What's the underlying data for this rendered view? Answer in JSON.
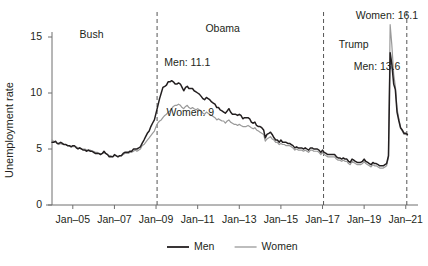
{
  "chart_data": {
    "type": "line",
    "title": "",
    "xlabel": "",
    "ylabel": "Unemployment rate",
    "xlim": [
      2004.0,
      2021.3
    ],
    "ylim": [
      0,
      17.5
    ],
    "yticks": [
      0,
      5,
      10,
      15
    ],
    "ytick_labels": [
      "0",
      "5",
      "10",
      "15"
    ],
    "xticks": [
      2005.0,
      2007.0,
      2009.0,
      2011.0,
      2013.0,
      2015.0,
      2017.0,
      2019.0,
      2021.0
    ],
    "xtick_labels": [
      "Jan–05",
      "Jan–07",
      "Jan–09",
      "Jan–11",
      "Jan–13",
      "Jan–15",
      "Jan–17",
      "Jan–19",
      "Jan–21"
    ],
    "grid": false,
    "legend_position": "bottom-center",
    "colors": {
      "men": "#231f20",
      "women": "#9a9a9a",
      "axis": "#6f6f6f",
      "annotation_line": "#555555"
    },
    "annotations": [
      {
        "id": "bush",
        "text": "Bush",
        "x": 2005.9,
        "y": 15.2
      },
      {
        "id": "obama",
        "text": "Obama",
        "x": 2012.2,
        "y": 15.7
      },
      {
        "id": "trump",
        "text": "Trump",
        "x": 2018.5,
        "y": 14.3
      },
      {
        "id": "men-peak-2009",
        "text": "Men: 11.1",
        "x": 2009.4,
        "y": 12.7
      },
      {
        "id": "women-peak-2009",
        "text": "Women: 9",
        "x": 2009.5,
        "y": 8.2
      },
      {
        "id": "women-peak-2020",
        "text": "Women: 16.1",
        "x": 2018.6,
        "y": 16.9
      },
      {
        "id": "men-peak-2020",
        "text": "Men: 13.6",
        "x": 2018.5,
        "y": 12.3
      }
    ],
    "vertical_markers": [
      {
        "id": "inauguration-2009",
        "x": 2009.05,
        "style": "dashed"
      },
      {
        "id": "inauguration-2017",
        "x": 2017.05,
        "style": "dashed"
      },
      {
        "id": "inauguration-2021",
        "x": 2021.05,
        "style": "dashed"
      }
    ],
    "legend": [
      {
        "id": "men",
        "label": "Men",
        "color": "#231f20"
      },
      {
        "id": "women",
        "label": "Women",
        "color": "#9a9a9a"
      }
    ],
    "series": [
      {
        "name": "Men",
        "color": "#231f20",
        "x": [
          2004.0,
          2004.08,
          2004.17,
          2004.25,
          2004.33,
          2004.42,
          2004.5,
          2004.58,
          2004.67,
          2004.75,
          2004.83,
          2004.92,
          2005.0,
          2005.08,
          2005.17,
          2005.25,
          2005.33,
          2005.42,
          2005.5,
          2005.58,
          2005.67,
          2005.75,
          2005.83,
          2005.92,
          2006.0,
          2006.08,
          2006.17,
          2006.25,
          2006.33,
          2006.42,
          2006.5,
          2006.58,
          2006.67,
          2006.75,
          2006.83,
          2006.92,
          2007.0,
          2007.08,
          2007.17,
          2007.25,
          2007.33,
          2007.42,
          2007.5,
          2007.58,
          2007.67,
          2007.75,
          2007.83,
          2007.92,
          2008.0,
          2008.08,
          2008.17,
          2008.25,
          2008.33,
          2008.42,
          2008.5,
          2008.58,
          2008.67,
          2008.75,
          2008.83,
          2008.92,
          2009.0,
          2009.08,
          2009.17,
          2009.25,
          2009.33,
          2009.42,
          2009.5,
          2009.58,
          2009.67,
          2009.75,
          2009.83,
          2009.92,
          2010.0,
          2010.08,
          2010.17,
          2010.25,
          2010.33,
          2010.42,
          2010.5,
          2010.58,
          2010.67,
          2010.75,
          2010.83,
          2010.92,
          2011.0,
          2011.08,
          2011.17,
          2011.25,
          2011.33,
          2011.42,
          2011.5,
          2011.58,
          2011.67,
          2011.75,
          2011.83,
          2011.92,
          2012.0,
          2012.08,
          2012.17,
          2012.25,
          2012.33,
          2012.42,
          2012.5,
          2012.58,
          2012.67,
          2012.75,
          2012.83,
          2012.92,
          2013.0,
          2013.08,
          2013.17,
          2013.25,
          2013.33,
          2013.42,
          2013.5,
          2013.58,
          2013.67,
          2013.75,
          2013.83,
          2013.92,
          2014.0,
          2014.08,
          2014.17,
          2014.25,
          2014.33,
          2014.42,
          2014.5,
          2014.58,
          2014.67,
          2014.75,
          2014.83,
          2014.92,
          2015.0,
          2015.08,
          2015.17,
          2015.25,
          2015.33,
          2015.42,
          2015.5,
          2015.58,
          2015.67,
          2015.75,
          2015.83,
          2015.92,
          2016.0,
          2016.08,
          2016.17,
          2016.25,
          2016.33,
          2016.42,
          2016.5,
          2016.58,
          2016.67,
          2016.75,
          2016.83,
          2016.92,
          2017.0,
          2017.08,
          2017.17,
          2017.25,
          2017.33,
          2017.42,
          2017.5,
          2017.58,
          2017.67,
          2017.75,
          2017.83,
          2017.92,
          2018.0,
          2018.08,
          2018.17,
          2018.25,
          2018.33,
          2018.42,
          2018.5,
          2018.58,
          2018.67,
          2018.75,
          2018.83,
          2018.92,
          2019.0,
          2019.08,
          2019.17,
          2019.25,
          2019.33,
          2019.42,
          2019.5,
          2019.58,
          2019.67,
          2019.75,
          2019.83,
          2019.92,
          2020.0,
          2020.08,
          2020.17,
          2020.25,
          2020.33,
          2020.42,
          2020.5,
          2020.58,
          2020.67,
          2020.75,
          2020.83,
          2020.92,
          2021.0,
          2021.08
        ],
        "values": [
          5.6,
          5.6,
          5.7,
          5.5,
          5.5,
          5.6,
          5.5,
          5.4,
          5.4,
          5.3,
          5.3,
          5.2,
          5.3,
          5.3,
          5.1,
          5.0,
          5.1,
          5.0,
          4.9,
          4.9,
          4.8,
          4.9,
          4.8,
          4.8,
          4.7,
          4.6,
          4.6,
          4.6,
          4.5,
          4.6,
          4.8,
          4.6,
          4.5,
          4.3,
          4.3,
          4.3,
          4.5,
          4.4,
          4.3,
          4.4,
          4.4,
          4.6,
          4.7,
          4.7,
          4.7,
          4.8,
          4.8,
          5.0,
          5.0,
          5.0,
          5.1,
          5.2,
          5.5,
          5.8,
          6.1,
          6.4,
          6.6,
          7.0,
          7.3,
          7.6,
          8.2,
          8.8,
          9.5,
          10.0,
          10.5,
          10.6,
          10.7,
          11.0,
          11.0,
          11.1,
          11.0,
          10.8,
          10.8,
          10.9,
          10.8,
          10.5,
          10.2,
          10.5,
          10.6,
          10.4,
          10.4,
          10.4,
          10.2,
          10.1,
          10.0,
          9.9,
          9.7,
          9.5,
          9.4,
          9.6,
          9.5,
          9.4,
          9.2,
          9.1,
          9.0,
          8.7,
          8.7,
          8.5,
          8.4,
          8.3,
          8.2,
          8.4,
          8.6,
          8.3,
          8.1,
          8.1,
          8.1,
          8.0,
          8.1,
          8.0,
          7.7,
          7.8,
          7.8,
          7.8,
          7.7,
          7.4,
          7.3,
          7.4,
          7.1,
          7.0,
          7.0,
          6.9,
          6.7,
          6.0,
          6.3,
          6.4,
          6.5,
          6.3,
          6.0,
          5.8,
          5.8,
          5.6,
          5.8,
          5.6,
          5.6,
          5.6,
          5.5,
          5.5,
          5.4,
          5.3,
          5.1,
          5.2,
          5.1,
          5.1,
          5.1,
          5.0,
          5.1,
          5.0,
          4.9,
          5.1,
          5.1,
          5.0,
          5.0,
          5.0,
          4.9,
          4.7,
          4.9,
          4.7,
          4.6,
          4.5,
          4.5,
          4.5,
          4.5,
          4.5,
          4.3,
          4.2,
          4.2,
          4.1,
          4.2,
          4.1,
          4.1,
          3.9,
          3.8,
          4.1,
          4.0,
          3.9,
          3.8,
          3.8,
          3.8,
          3.9,
          4.1,
          3.9,
          3.8,
          3.7,
          3.6,
          3.8,
          3.7,
          3.7,
          3.6,
          3.5,
          3.5,
          3.5,
          3.6,
          3.7,
          4.4,
          13.6,
          12.6,
          10.8,
          10.3,
          8.3,
          7.5,
          6.9,
          6.7,
          6.4,
          6.4,
          6.3
        ]
      },
      {
        "name": "Women",
        "color": "#9a9a9a",
        "x": [
          2004.0,
          2004.08,
          2004.17,
          2004.25,
          2004.33,
          2004.42,
          2004.5,
          2004.58,
          2004.67,
          2004.75,
          2004.83,
          2004.92,
          2005.0,
          2005.08,
          2005.17,
          2005.25,
          2005.33,
          2005.42,
          2005.5,
          2005.58,
          2005.67,
          2005.75,
          2005.83,
          2005.92,
          2006.0,
          2006.08,
          2006.17,
          2006.25,
          2006.33,
          2006.42,
          2006.5,
          2006.58,
          2006.67,
          2006.75,
          2006.83,
          2006.92,
          2007.0,
          2007.08,
          2007.17,
          2007.25,
          2007.33,
          2007.42,
          2007.5,
          2007.58,
          2007.67,
          2007.75,
          2007.83,
          2007.92,
          2008.0,
          2008.08,
          2008.17,
          2008.25,
          2008.33,
          2008.42,
          2008.5,
          2008.58,
          2008.67,
          2008.75,
          2008.83,
          2008.92,
          2009.0,
          2009.08,
          2009.17,
          2009.25,
          2009.33,
          2009.42,
          2009.5,
          2009.58,
          2009.67,
          2009.75,
          2009.83,
          2009.92,
          2010.0,
          2010.08,
          2010.17,
          2010.25,
          2010.33,
          2010.42,
          2010.5,
          2010.58,
          2010.67,
          2010.75,
          2010.83,
          2010.92,
          2011.0,
          2011.08,
          2011.17,
          2011.25,
          2011.33,
          2011.42,
          2011.5,
          2011.58,
          2011.67,
          2011.75,
          2011.83,
          2011.92,
          2012.0,
          2012.08,
          2012.17,
          2012.25,
          2012.33,
          2012.42,
          2012.5,
          2012.58,
          2012.67,
          2012.75,
          2012.83,
          2012.92,
          2013.0,
          2013.08,
          2013.17,
          2013.25,
          2013.33,
          2013.42,
          2013.5,
          2013.58,
          2013.67,
          2013.75,
          2013.83,
          2013.92,
          2014.0,
          2014.08,
          2014.17,
          2014.25,
          2014.33,
          2014.42,
          2014.5,
          2014.58,
          2014.67,
          2014.75,
          2014.83,
          2014.92,
          2015.0,
          2015.08,
          2015.17,
          2015.25,
          2015.33,
          2015.42,
          2015.5,
          2015.58,
          2015.67,
          2015.75,
          2015.83,
          2015.92,
          2016.0,
          2016.08,
          2016.17,
          2016.25,
          2016.33,
          2016.42,
          2016.5,
          2016.58,
          2016.67,
          2016.75,
          2016.83,
          2016.92,
          2017.0,
          2017.08,
          2017.17,
          2017.25,
          2017.33,
          2017.42,
          2017.5,
          2017.58,
          2017.67,
          2017.75,
          2017.83,
          2017.92,
          2018.0,
          2018.08,
          2018.17,
          2018.25,
          2018.33,
          2018.42,
          2018.5,
          2018.58,
          2018.67,
          2018.75,
          2018.83,
          2018.92,
          2019.0,
          2019.08,
          2019.17,
          2019.25,
          2019.33,
          2019.42,
          2019.5,
          2019.58,
          2019.67,
          2019.75,
          2019.83,
          2019.92,
          2020.0,
          2020.08,
          2020.17,
          2020.25,
          2020.33,
          2020.42,
          2020.5,
          2020.58,
          2020.67,
          2020.75,
          2020.83,
          2020.92,
          2021.0,
          2021.08
        ],
        "values": [
          5.8,
          5.7,
          5.6,
          5.5,
          5.4,
          5.5,
          5.4,
          5.4,
          5.4,
          5.3,
          5.3,
          5.2,
          5.2,
          5.2,
          5.2,
          5.1,
          5.1,
          5.0,
          5.0,
          5.0,
          4.9,
          4.9,
          4.9,
          4.8,
          4.8,
          4.7,
          4.7,
          4.6,
          4.6,
          4.6,
          4.7,
          4.6,
          4.5,
          4.4,
          4.4,
          4.3,
          4.4,
          4.4,
          4.3,
          4.4,
          4.4,
          4.5,
          4.6,
          4.6,
          4.6,
          4.7,
          4.7,
          4.8,
          4.9,
          4.8,
          4.9,
          5.0,
          5.3,
          5.4,
          5.6,
          5.8,
          6.0,
          6.2,
          6.4,
          6.6,
          7.0,
          7.3,
          7.5,
          7.6,
          7.8,
          8.0,
          8.1,
          8.3,
          8.4,
          8.6,
          8.8,
          8.9,
          8.9,
          9.0,
          8.9,
          8.7,
          8.6,
          8.8,
          8.9,
          8.7,
          8.6,
          8.7,
          8.6,
          8.5,
          8.6,
          8.5,
          8.4,
          8.2,
          8.1,
          8.3,
          8.2,
          8.1,
          8.0,
          7.9,
          7.8,
          7.6,
          7.7,
          7.6,
          7.5,
          7.5,
          7.3,
          7.5,
          7.6,
          7.4,
          7.3,
          7.2,
          7.2,
          7.1,
          7.2,
          7.1,
          7.0,
          7.0,
          7.0,
          7.1,
          7.0,
          6.9,
          6.8,
          6.9,
          6.7,
          6.6,
          6.5,
          6.4,
          6.3,
          5.7,
          5.9,
          6.0,
          6.1,
          5.9,
          5.8,
          5.6,
          5.6,
          5.4,
          5.5,
          5.4,
          5.4,
          5.3,
          5.3,
          5.3,
          5.2,
          5.1,
          4.9,
          5.0,
          4.9,
          4.9,
          4.9,
          4.8,
          4.9,
          4.8,
          4.7,
          4.9,
          4.9,
          4.8,
          4.8,
          4.8,
          4.7,
          4.5,
          4.7,
          4.5,
          4.4,
          4.3,
          4.3,
          4.3,
          4.3,
          4.3,
          4.1,
          4.0,
          4.0,
          3.9,
          4.0,
          3.9,
          3.9,
          3.7,
          3.6,
          3.9,
          3.8,
          3.7,
          3.6,
          3.6,
          3.6,
          3.7,
          3.9,
          3.7,
          3.6,
          3.5,
          3.4,
          3.6,
          3.5,
          3.5,
          3.4,
          3.3,
          3.3,
          3.3,
          3.4,
          3.5,
          4.3,
          16.1,
          14.3,
          11.7,
          10.6,
          8.6,
          7.7,
          6.9,
          6.6,
          6.3,
          6.3,
          6.2
        ]
      }
    ]
  }
}
